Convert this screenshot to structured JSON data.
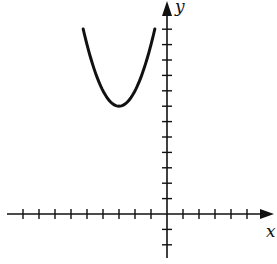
{
  "chart_data": {
    "type": "line",
    "title": "",
    "xlabel": "x",
    "ylabel": "y",
    "function": "y = (x + 3)^2 + 7",
    "vertex": [
      -3,
      7
    ],
    "domain_shown": [
      -5.24,
      -0.76
    ],
    "xlim": [
      -10,
      6.5
    ],
    "ylim": [
      -3,
      13
    ],
    "x_ticks": [
      -9,
      -8,
      -7,
      -6,
      -5,
      -4,
      -3,
      -2,
      -1,
      1,
      2,
      3,
      4,
      5
    ],
    "y_ticks": [
      -2,
      -1,
      1,
      2,
      3,
      4,
      5,
      6,
      7,
      8,
      9,
      10,
      11,
      12
    ],
    "tick_labels_shown": false,
    "grid": false,
    "series": [
      {
        "name": "parabola",
        "color": "#111111"
      }
    ]
  },
  "labels": {
    "x": "x",
    "y": "y"
  }
}
